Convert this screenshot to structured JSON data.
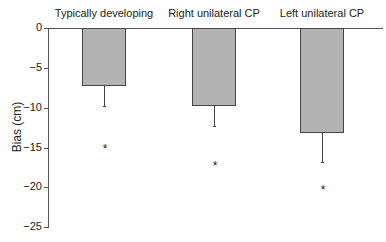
{
  "chart_data": {
    "type": "bar",
    "title": "",
    "xlabel": "",
    "ylabel": "Bias (cm)",
    "categories": [
      "Typically developing",
      "Right unilateral CP",
      "Left unilateral CP"
    ],
    "values": [
      -7.2,
      -9.6,
      -13.1
    ],
    "error_bars": [
      2.6,
      2.7,
      3.7
    ],
    "significance_markers": [
      "*",
      "*",
      "*"
    ],
    "significance_marker_y": [
      -14.8,
      -17.0,
      -20.0
    ],
    "ylim": [
      -25,
      0
    ],
    "yticks": [
      0,
      -5,
      -10,
      -15,
      -20,
      -25
    ],
    "ytick_labels": [
      "0",
      "−5",
      "−10",
      "−15",
      "−20",
      "−25"
    ],
    "grid": false,
    "legend": null,
    "bar_color": "#b3b3b3",
    "category_labels_position": "top"
  }
}
